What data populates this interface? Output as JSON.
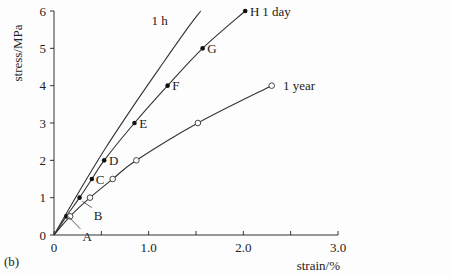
{
  "figure_label": "(b)",
  "chart_data": {
    "type": "line",
    "title": "",
    "xlabel": "strain/%",
    "ylabel": "stress/MPa",
    "xlim": [
      0,
      3.0
    ],
    "ylim": [
      0,
      6
    ],
    "x_ticks": [
      0,
      0.5,
      1.0,
      1.5,
      2.0,
      2.5,
      3.0
    ],
    "x_tick_labels": [
      "0",
      "",
      "1.0",
      "",
      "2.0",
      "",
      "3.0"
    ],
    "y_ticks": [
      0,
      1,
      2,
      3,
      4,
      5,
      6
    ],
    "y_tick_labels": [
      "0",
      "1",
      "2",
      "3",
      "4",
      "5",
      "6"
    ],
    "grid": false,
    "legend": "inline curve labels",
    "series": [
      {
        "name": "1 h",
        "marker": "none",
        "x": [
          0,
          0.25,
          0.55,
          0.85,
          1.15,
          1.4,
          1.55
        ],
        "y": [
          0,
          1.1,
          2.35,
          3.5,
          4.6,
          5.5,
          6.0
        ],
        "label_pos": [
          1.03,
          5.75
        ]
      },
      {
        "name": "1 day",
        "marker": "filled-circle",
        "x": [
          0,
          0.13,
          0.27,
          0.4,
          0.53,
          0.85,
          1.2,
          1.57,
          2.02
        ],
        "y": [
          0,
          0.5,
          1.0,
          1.5,
          2.0,
          3.0,
          4.0,
          5.0,
          6.0
        ],
        "point_labels": [
          "",
          "A",
          "B",
          "C",
          "D",
          "E",
          "F",
          "G",
          "H"
        ],
        "label_pos": [
          2.2,
          6.0
        ]
      },
      {
        "name": "1 year",
        "marker": "open-circle",
        "x": [
          0,
          0.17,
          0.38,
          0.62,
          0.87,
          1.52,
          2.3
        ],
        "y": [
          0,
          0.5,
          1.0,
          1.5,
          2.0,
          3.0,
          4.0
        ],
        "label_pos": [
          2.42,
          4.0
        ]
      }
    ],
    "annotations": [
      {
        "text": "A",
        "x": 0.3,
        "y": -0.05,
        "leader_to": [
          0.15,
          0.5
        ]
      },
      {
        "text": "B",
        "x": 0.42,
        "y": 0.52,
        "leader_to": [
          0.3,
          0.9
        ]
      },
      {
        "text": "C",
        "x": 0.44,
        "y": 1.5
      },
      {
        "text": "D",
        "x": 0.58,
        "y": 2.0
      },
      {
        "text": "E",
        "x": 0.9,
        "y": 3.0
      },
      {
        "text": "F",
        "x": 1.25,
        "y": 4.0
      },
      {
        "text": "G",
        "x": 1.62,
        "y": 5.0
      },
      {
        "text": "H",
        "x": 2.07,
        "y": 6.0
      }
    ]
  }
}
